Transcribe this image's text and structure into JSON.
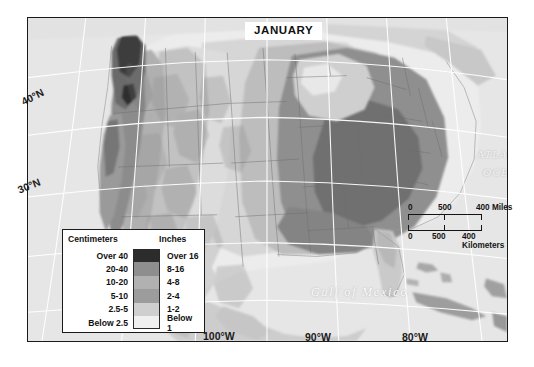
{
  "map": {
    "title": "JANUARY",
    "graticule": {
      "lat_40": "40°N",
      "lat_30": "30°N",
      "lon_100": "100°W",
      "lon_90": "90°W",
      "lon_80": "80°W"
    },
    "water_labels": {
      "atlantic_line1": "ATLANTIC",
      "atlantic_line2": "OCEAN",
      "gulf": "Gulf of Mexico"
    }
  },
  "legend": {
    "header_left": "Centimeters",
    "header_right": "Inches",
    "rows": [
      {
        "cm": "Over 40",
        "inches": "Over 16",
        "color": "#2c2c2c"
      },
      {
        "cm": "20-40",
        "inches": "8-16",
        "color": "#8e8e8e"
      },
      {
        "cm": "10-20",
        "inches": "4-8",
        "color": "#b1b1b1"
      },
      {
        "cm": "5-10",
        "inches": "2-4",
        "color": "#9c9c9c"
      },
      {
        "cm": "2.5-5",
        "inches": "1-2",
        "color": "#cfcfcf"
      },
      {
        "cm": "Below 2.5",
        "inches": "Below 1",
        "color": "#f0f0f0"
      }
    ]
  },
  "scalebar": {
    "miles": {
      "zero": "0",
      "mid": "500",
      "end": "400 Miles"
    },
    "kilometers": {
      "zero": "0",
      "mid": "500",
      "end": "400 Kilometers"
    }
  },
  "colors": {
    "frame": "#1a1a1a",
    "ocean": "#e4e4e4",
    "land_base": "#d8d8d8",
    "graticule": "#ffffff"
  }
}
